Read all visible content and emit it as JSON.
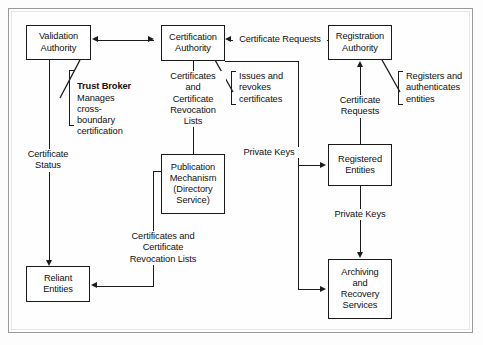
{
  "figure": {
    "type": "block-flow-diagram"
  },
  "nodes": {
    "validation_authority": "Validation\nAuthority",
    "certification_authority": "Certification\nAuthority",
    "registration_authority": "Registration\nAuthority",
    "publication_mechanism": "Publication\nMechanism\n(Directory\nService)",
    "registered_entities": "Registered\nEntities",
    "reliant_entities": "Reliant\nEntities",
    "archiving_recovery": "Archiving\nand\nRecovery\nServices"
  },
  "edge_labels": {
    "certificate_requests_ra_to_ca": "Certificate Requests",
    "certificates_and_crl_ca_to_pub": "Certificates\nand\nCertificate\nRevocation\nLists",
    "certificate_requests_re_to_ra": "Certificate\nRequests",
    "private_keys_ca_to_re": "Private Keys",
    "private_keys_re_to_ar": "Private Keys",
    "certificate_status_va_to_reliant": "Certificate\nStatus",
    "certificates_and_crl_pub_to_reliant": "Certificates and\nCertificate\nRevocation Lists"
  },
  "callouts": {
    "trust_broker": {
      "heading": "Trust Broker",
      "body": "Manages\ncross-\nboundary\ncertification"
    },
    "issues_revokes": {
      "body": "Issues and\nrevokes\ncertificates"
    },
    "registers_authenticates": {
      "body": "Registers and\nauthenticates\nentities"
    }
  },
  "colors": {
    "line": "#1b1b1b",
    "box_border": "#1a1a1a",
    "frame": "#9a9a9a",
    "background": "#fefefe",
    "text": "#111111"
  }
}
